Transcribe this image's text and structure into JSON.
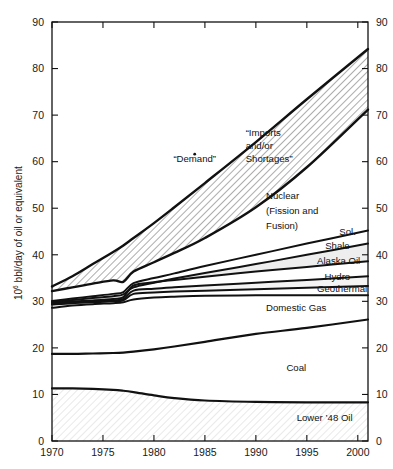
{
  "chart_data": {
    "type": "area",
    "title": "",
    "subtitle": "",
    "xlabel": "",
    "ylabel": "10⁶ bbl/day of oil or equivalent",
    "ylabel_base": "10",
    "ylabel_exp": "6",
    "ylabel_rest": " bbl/day of oil or equivalent",
    "xlim": [
      1970,
      2001
    ],
    "ylim": [
      0,
      90
    ],
    "grid": false,
    "legend_position": "inline-annotations",
    "x_ticks": [
      "1970",
      "1975",
      "1980",
      "1985",
      "1990",
      "1995",
      "2000"
    ],
    "x_tick_values": [
      1970,
      1975,
      1980,
      1985,
      1990,
      1995,
      2000
    ],
    "y_ticks_left": [
      "0",
      "10",
      "20",
      "30",
      "40",
      "50",
      "60",
      "70",
      "80",
      "90"
    ],
    "y_ticks_right": [
      "0",
      "10",
      "20",
      "30",
      "40",
      "50",
      "60",
      "70",
      "80",
      "90"
    ],
    "y_tick_values": [
      0,
      10,
      20,
      30,
      40,
      50,
      60,
      70,
      80,
      90
    ],
    "x": [
      1970,
      1972,
      1974,
      1976,
      1977,
      1978,
      1980,
      1982,
      1985,
      1990,
      1995,
      2001
    ],
    "annotations": [
      {
        "text": "“Demand”",
        "x": 1984,
        "y": 60.0,
        "name": "demand-label"
      },
      {
        "text": "“Imports",
        "x": 1989,
        "y": 65.5,
        "name": "imports-label-line1"
      },
      {
        "text": "and/or",
        "x": 1989,
        "y": 62.7,
        "name": "imports-label-line2"
      },
      {
        "text": "Shortages”",
        "x": 1989,
        "y": 59.9,
        "name": "imports-label-line3"
      },
      {
        "text": "Nuclear",
        "x": 1991,
        "y": 52.0,
        "name": "nuclear-label-line1"
      },
      {
        "text": "(Fission and",
        "x": 1991,
        "y": 48.8,
        "name": "nuclear-label-line2"
      },
      {
        "text": "Fusion)",
        "x": 1991,
        "y": 45.6,
        "name": "nuclear-label-line3"
      },
      {
        "text": "Sol.",
        "x": 1999,
        "y": 44.2,
        "name": "solar-label"
      },
      {
        "text": "Shale",
        "x": 1998,
        "y": 41.3,
        "name": "shale-label"
      },
      {
        "text": "Alaska Oil",
        "x": 1996,
        "y": 38.0,
        "name": "alaska-oil-label"
      },
      {
        "text": "Hydro",
        "x": 1998,
        "y": 34.6,
        "name": "hydro-label"
      },
      {
        "text": "Geothermal",
        "x": 1996,
        "y": 32.0,
        "name": "geothermal-label"
      },
      {
        "text": "Domestic Gas",
        "x": 1991,
        "y": 28.0,
        "name": "domestic-gas-label"
      },
      {
        "text": "Coal",
        "x": 1993,
        "y": 15.0,
        "name": "coal-label"
      },
      {
        "text": "Lower ’48 Oil",
        "x": 1994,
        "y": 4.2,
        "name": "lower-48-oil-label"
      }
    ],
    "series": [
      {
        "name": "Demand",
        "hatched_band_top": true,
        "values": [
          33.2,
          35.4,
          38.0,
          40.6,
          42.0,
          43.6,
          46.8,
          50.2,
          55.4,
          64.2,
          73.4,
          84.2
        ]
      },
      {
        "name": "Total Supply (top of stack)",
        "values": [
          32.2,
          33.0,
          33.8,
          34.5,
          34.2,
          36.4,
          38.4,
          40.4,
          43.6,
          50.2,
          58.8,
          71.2
        ]
      },
      {
        "name": "Solar",
        "values": [
          30.1,
          30.6,
          31.1,
          31.6,
          32.0,
          33.9,
          35.0,
          36.0,
          37.6,
          40.0,
          42.4,
          45.2
        ]
      },
      {
        "name": "Shale",
        "values": [
          29.9,
          30.3,
          30.7,
          31.1,
          31.5,
          33.0,
          34.0,
          34.9,
          36.1,
          38.0,
          40.0,
          42.4
        ]
      },
      {
        "name": "Alaska Oil",
        "values": [
          29.7,
          30.0,
          30.2,
          30.5,
          30.9,
          33.4,
          34.1,
          34.6,
          35.3,
          36.4,
          37.4,
          38.6
        ]
      },
      {
        "name": "Hydro",
        "values": [
          29.5,
          29.8,
          30.0,
          30.2,
          30.5,
          32.3,
          32.7,
          33.0,
          33.4,
          34.0,
          34.6,
          35.4
        ]
      },
      {
        "name": "Geothermal",
        "values": [
          29.3,
          29.6,
          29.8,
          30.0,
          30.2,
          31.6,
          31.9,
          32.1,
          32.3,
          32.6,
          32.9,
          33.3
        ]
      },
      {
        "name": "Domestic Gas",
        "values": [
          28.6,
          29.1,
          29.4,
          29.6,
          29.8,
          30.4,
          30.8,
          31.0,
          31.2,
          31.3,
          31.3,
          31.3
        ]
      },
      {
        "name": "Coal",
        "values": [
          18.7,
          18.7,
          18.8,
          18.9,
          19.0,
          19.2,
          19.7,
          20.3,
          21.3,
          23.0,
          24.3,
          26.1
        ]
      },
      {
        "name": "Lower '48 Oil",
        "values": [
          11.3,
          11.3,
          11.2,
          11.0,
          10.8,
          10.5,
          9.8,
          9.2,
          8.7,
          8.4,
          8.3,
          8.3
        ]
      }
    ]
  }
}
